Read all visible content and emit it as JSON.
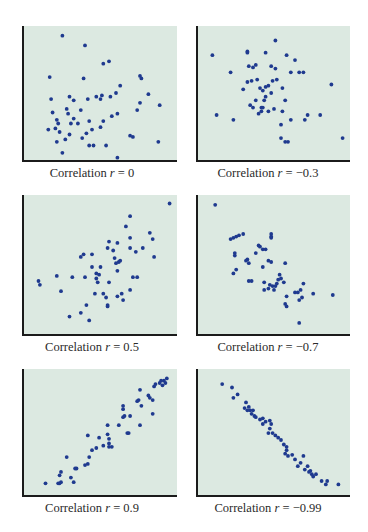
{
  "colors": {
    "background": "#dce9e1",
    "dot": "#1f3a8f",
    "axis": "#1b1b1b"
  },
  "chart_data": [
    {
      "type": "scatter",
      "title": "Correlation r = 0",
      "caption_prefix": "Correlation ",
      "caption_var": "r",
      "caption_value": " = 0",
      "r": 0,
      "xlabel": "",
      "ylabel": "",
      "grid": false,
      "axes_ticks": false,
      "x": [
        0.23,
        0.39,
        0.52,
        0.56,
        0.14,
        0.38,
        0.78,
        0.79,
        0.64,
        0.15,
        0.41,
        0.47,
        0.51,
        0.57,
        0.61,
        0.78,
        0.84,
        0.92,
        0.28,
        0.31,
        0.5,
        0.26,
        0.36,
        0.16,
        0.76,
        0.27,
        0.19,
        0.31,
        0.34,
        0.42,
        0.52,
        0.58,
        0.62,
        0.2,
        0.29,
        0.44,
        0.5,
        0.4,
        0.18,
        0.13,
        0.21,
        0.25,
        0.28,
        0.37,
        0.54,
        0.71,
        0.73,
        0.19,
        0.42,
        0.45,
        0.91,
        0.23,
        0.62
      ],
      "y": [
        0.97,
        0.89,
        0.74,
        0.76,
        0.63,
        0.62,
        0.64,
        0.62,
        0.56,
        0.45,
        0.45,
        0.47,
        0.48,
        0.47,
        0.5,
        0.42,
        0.49,
        0.4,
        0.47,
        0.44,
        0.45,
        0.37,
        0.36,
        0.34,
        0.36,
        0.33,
        0.28,
        0.29,
        0.25,
        0.27,
        0.27,
        0.31,
        0.33,
        0.25,
        0.25,
        0.2,
        0.22,
        0.17,
        0.21,
        0.2,
        0.18,
        0.12,
        0.16,
        0.13,
        0.07,
        0.15,
        0.14,
        0.1,
        0.07,
        0.07,
        0.1,
        0.01,
        -0.03
      ]
    },
    {
      "type": "scatter",
      "title": "Correlation r = −0.3",
      "caption_prefix": "Correlation ",
      "caption_var": "r",
      "caption_value": " = −0.3",
      "r": -0.3,
      "xlabel": "",
      "ylabel": "",
      "grid": false,
      "axes_ticks": false,
      "x": [
        0.51,
        0.31,
        0.31,
        0.44,
        0.59,
        0.65,
        0.06,
        0.32,
        0.35,
        0.37,
        0.48,
        0.51,
        0.19,
        0.62,
        0.68,
        0.71,
        0.34,
        0.38,
        0.31,
        0.52,
        0.49,
        0.46,
        0.44,
        0.4,
        0.42,
        0.28,
        0.56,
        0.91,
        0.44,
        0.48,
        0.37,
        0.43,
        0.58,
        0.35,
        0.41,
        0.46,
        0.42,
        0.41,
        0.56,
        0.5,
        0.09,
        0.21,
        0.74,
        0.83,
        0.72,
        0.62,
        0.39,
        0.55,
        0.55,
        0.58,
        0.6,
        0.99,
        0.33
      ],
      "y": [
        0.93,
        0.84,
        0.83,
        0.83,
        0.81,
        0.77,
        0.81,
        0.72,
        0.71,
        0.73,
        0.72,
        0.7,
        0.67,
        0.67,
        0.67,
        0.67,
        0.6,
        0.61,
        0.59,
        0.61,
        0.6,
        0.56,
        0.55,
        0.54,
        0.52,
        0.53,
        0.54,
        0.57,
        0.47,
        0.5,
        0.44,
        0.44,
        0.44,
        0.38,
        0.38,
        0.35,
        0.38,
        0.35,
        0.35,
        0.37,
        0.32,
        0.28,
        0.32,
        0.32,
        0.28,
        0.28,
        0.33,
        0.24,
        0.13,
        0.1,
        0.1,
        0.13,
        0.4
      ]
    },
    {
      "type": "scatter",
      "title": "Correlation r = 0.5",
      "caption_prefix": "Correlation ",
      "caption_var": "r",
      "caption_value": " = 0.5",
      "r": 0.5,
      "xlabel": "",
      "ylabel": "",
      "grid": false,
      "axes_ticks": false,
      "x": [
        0.99,
        0.71,
        0.68,
        0.85,
        0.71,
        0.87,
        0.71,
        0.8,
        0.75,
        0.88,
        0.56,
        0.62,
        0.55,
        0.59,
        0.36,
        0.38,
        0.44,
        0.6,
        0.64,
        0.63,
        0.61,
        0.44,
        0.5,
        0.47,
        0.49,
        0.47,
        0.62,
        0.39,
        0.48,
        0.56,
        0.73,
        0.76,
        0.06,
        0.07,
        0.19,
        0.3,
        0.52,
        0.65,
        0.71,
        0.46,
        0.54,
        0.55,
        0.55,
        0.66,
        0.4,
        0.36,
        0.42,
        0.22,
        0.62,
        0.28
      ],
      "y": [
        0.98,
        0.88,
        0.8,
        0.75,
        0.71,
        0.7,
        0.63,
        0.63,
        0.6,
        0.56,
        0.68,
        0.67,
        0.63,
        0.61,
        0.56,
        0.58,
        0.58,
        0.55,
        0.53,
        0.52,
        0.51,
        0.48,
        0.48,
        0.43,
        0.42,
        0.39,
        0.45,
        0.4,
        0.36,
        0.36,
        0.4,
        0.4,
        0.37,
        0.34,
        0.41,
        0.4,
        0.27,
        0.27,
        0.3,
        0.27,
        0.24,
        0.18,
        0.17,
        0.22,
        0.18,
        0.12,
        0.06,
        0.29,
        0.25,
        0.09
      ]
    },
    {
      "type": "scatter",
      "title": "Correlation r = −0.7",
      "caption_prefix": "Correlation ",
      "caption_var": "r",
      "caption_value": " = −0.7",
      "r": -0.7,
      "xlabel": "",
      "ylabel": "",
      "grid": false,
      "axes_ticks": false,
      "x": [
        0.08,
        0.28,
        0.25,
        0.23,
        0.21,
        0.19,
        0.48,
        0.48,
        0.48,
        0.39,
        0.4,
        0.42,
        0.44,
        0.37,
        0.22,
        0.22,
        0.31,
        0.3,
        0.32,
        0.46,
        0.48,
        0.42,
        0.58,
        0.23,
        0.21,
        0.54,
        0.55,
        0.53,
        0.57,
        0.71,
        0.32,
        0.34,
        0.43,
        0.47,
        0.49,
        0.51,
        0.52,
        0.5,
        0.46,
        0.43,
        0.65,
        0.67,
        0.69,
        0.59,
        0.78,
        0.92,
        0.7,
        0.68,
        0.58,
        0.59,
        0.68
      ],
      "y": [
        0.97,
        0.74,
        0.73,
        0.72,
        0.71,
        0.7,
        0.74,
        0.71,
        0.72,
        0.65,
        0.64,
        0.62,
        0.62,
        0.59,
        0.59,
        0.57,
        0.54,
        0.53,
        0.51,
        0.53,
        0.52,
        0.48,
        0.51,
        0.46,
        0.43,
        0.42,
        0.39,
        0.38,
        0.36,
        0.35,
        0.37,
        0.37,
        0.36,
        0.34,
        0.33,
        0.33,
        0.35,
        0.3,
        0.31,
        0.3,
        0.28,
        0.28,
        0.3,
        0.25,
        0.27,
        0.26,
        0.24,
        0.22,
        0.19,
        0.17,
        0.04
      ]
    },
    {
      "type": "scatter",
      "title": "Correlation r = 0.9",
      "caption_prefix": "Correlation ",
      "caption_var": "r",
      "caption_value": " = 0.9",
      "r": 0.9,
      "xlabel": "",
      "ylabel": "",
      "grid": false,
      "axes_ticks": false,
      "x": [
        0.97,
        0.95,
        0.93,
        0.92,
        0.96,
        0.89,
        0.94,
        0.78,
        0.88,
        0.84,
        0.85,
        0.77,
        0.76,
        0.79,
        0.87,
        0.66,
        0.66,
        0.66,
        0.67,
        0.71,
        0.87,
        0.78,
        0.55,
        0.63,
        0.69,
        0.7,
        0.49,
        0.55,
        0.41,
        0.56,
        0.56,
        0.56,
        0.58,
        0.52,
        0.47,
        0.44,
        0.42,
        0.26,
        0.41,
        0.39,
        0.33,
        0.32,
        0.22,
        0.21,
        0.29,
        0.31,
        0.21,
        0.2,
        0.11,
        0.22
      ],
      "y": [
        0.97,
        0.95,
        0.95,
        0.93,
        0.93,
        0.92,
        0.91,
        0.87,
        0.9,
        0.82,
        0.8,
        0.78,
        0.77,
        0.73,
        0.78,
        0.73,
        0.7,
        0.63,
        0.64,
        0.64,
        0.66,
        0.56,
        0.56,
        0.56,
        0.49,
        0.49,
        0.45,
        0.48,
        0.47,
        0.44,
        0.4,
        0.37,
        0.37,
        0.38,
        0.36,
        0.34,
        0.28,
        0.28,
        0.22,
        0.21,
        0.18,
        0.18,
        0.15,
        0.12,
        0.1,
        0.06,
        0.05,
        0.05,
        0.05,
        0.06
      ]
    },
    {
      "type": "scatter",
      "title": "Correlation r = −0.99",
      "caption_prefix": "Correlation ",
      "caption_var": "r",
      "caption_value": " = −0.99",
      "r": -0.99,
      "xlabel": "",
      "ylabel": "",
      "grid": false,
      "axes_ticks": false,
      "x": [
        0.13,
        0.2,
        0.24,
        0.21,
        0.3,
        0.29,
        0.32,
        0.33,
        0.35,
        0.31,
        0.34,
        0.36,
        0.37,
        0.4,
        0.44,
        0.42,
        0.47,
        0.48,
        0.42,
        0.47,
        0.46,
        0.49,
        0.51,
        0.53,
        0.55,
        0.57,
        0.59,
        0.59,
        0.58,
        0.6,
        0.63,
        0.65,
        0.71,
        0.69,
        0.74,
        0.67,
        0.72,
        0.76,
        0.75,
        0.77,
        0.8,
        0.78,
        0.84,
        0.88,
        0.87,
        0.96
      ],
      "y": [
        0.92,
        0.89,
        0.83,
        0.8,
        0.76,
        0.71,
        0.72,
        0.69,
        0.69,
        0.69,
        0.66,
        0.64,
        0.63,
        0.61,
        0.59,
        0.57,
        0.6,
        0.57,
        0.62,
        0.53,
        0.49,
        0.49,
        0.47,
        0.45,
        0.43,
        0.39,
        0.37,
        0.34,
        0.31,
        0.29,
        0.3,
        0.26,
        0.29,
        0.23,
        0.2,
        0.2,
        0.17,
        0.16,
        0.15,
        0.13,
        0.13,
        0.11,
        0.07,
        0.07,
        0.04,
        0.04
      ]
    }
  ]
}
